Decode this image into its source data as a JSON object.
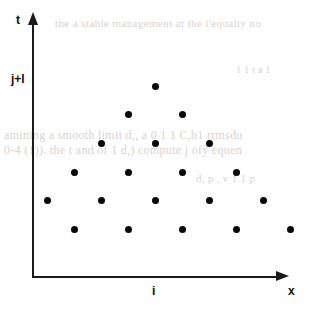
{
  "figure": {
    "width": 313,
    "height": 316,
    "background_color": "#fefefe",
    "ink_color": "#0a0a0a"
  },
  "axes": {
    "vertical": {
      "label": "t",
      "arrow": "up-arrow-icon",
      "origin_px": [
        33,
        277
      ],
      "top_px": [
        33,
        12
      ]
    },
    "horizontal": {
      "label": "x",
      "arrow": "right-arrow-icon",
      "origin_px": [
        33,
        277
      ],
      "right_px": [
        289,
        277
      ]
    },
    "tick_labels": {
      "y": "j+l",
      "x": "i"
    }
  },
  "chart_data": {
    "type": "scatter",
    "title": "",
    "xlabel": "x",
    "ylabel": "t",
    "grid": false,
    "legend": null,
    "annotations": [
      {
        "text": "j+l",
        "axis": "y",
        "pixel": [
          11,
          73
        ]
      },
      {
        "text": "i",
        "axis": "x",
        "pixel": [
          152,
          285
        ]
      }
    ],
    "marker": {
      "shape": "circle",
      "size_px": 7,
      "color": "#080808",
      "filled": true
    },
    "lattice": {
      "x_spacing_px": 54,
      "y_spacing_px": 28.6,
      "row_offset_px": 27,
      "apex_px": [
        155,
        86
      ]
    },
    "rows": [
      {
        "row": 0,
        "y_px": 229,
        "count": 5,
        "x_px": [
          74,
          128,
          182,
          236,
          290
        ]
      },
      {
        "row": 1,
        "y_px": 200,
        "count": 5,
        "x_px": [
          47,
          101,
          155,
          209,
          263
        ]
      },
      {
        "row": 2,
        "y_px": 172,
        "count": 4,
        "x_px": [
          74,
          128,
          182,
          236
        ]
      },
      {
        "row": 3,
        "y_px": 143,
        "count": 3,
        "x_px": [
          101,
          155,
          209
        ]
      },
      {
        "row": 4,
        "y_px": 114,
        "count": 2,
        "x_px": [
          128,
          182
        ]
      },
      {
        "row": 5,
        "y_px": 86,
        "count": 1,
        "x_px": [
          155
        ]
      }
    ],
    "points": [
      [
        74,
        229
      ],
      [
        128,
        229
      ],
      [
        182,
        229
      ],
      [
        236,
        229
      ],
      [
        290,
        229
      ],
      [
        47,
        200
      ],
      [
        101,
        200
      ],
      [
        155,
        200
      ],
      [
        209,
        200
      ],
      [
        263,
        200
      ],
      [
        74,
        172
      ],
      [
        128,
        172
      ],
      [
        182,
        172
      ],
      [
        236,
        172
      ],
      [
        101,
        143
      ],
      [
        155,
        143
      ],
      [
        209,
        143
      ],
      [
        128,
        114
      ],
      [
        182,
        114
      ],
      [
        155,
        86
      ]
    ],
    "total_points": 20
  },
  "bleed_through_text": {
    "line_1": "the a stable management at the l'equalty no",
    "line_2": "amining a smooth limit d,, a 0 1 1 C,b1 rrmsdu",
    "line_3": "0-4 (1)). the t and of 1 d,) compute j ofy equen",
    "line_4": "d, p , v 1 1 p",
    "line_5": "1 1 t a 1"
  }
}
